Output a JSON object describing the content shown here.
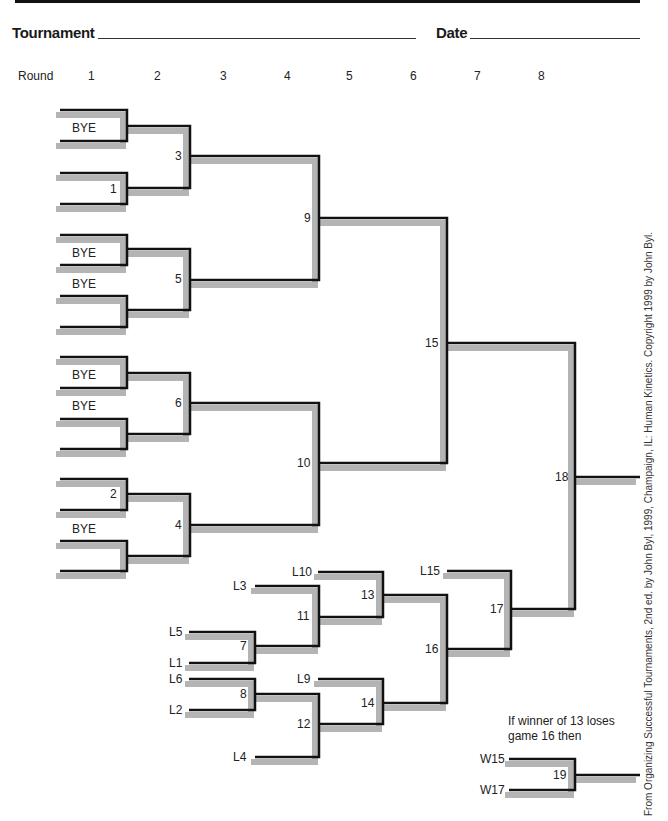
{
  "header": {
    "tournament_label": "Tournament",
    "date_label": "Date"
  },
  "rounds": {
    "label": "Round",
    "items": [
      {
        "n": "1",
        "x": 88
      },
      {
        "n": "2",
        "x": 154
      },
      {
        "n": "3",
        "x": 220
      },
      {
        "n": "4",
        "x": 284
      },
      {
        "n": "5",
        "x": 346
      },
      {
        "n": "6",
        "x": 410
      },
      {
        "n": "7",
        "x": 474
      },
      {
        "n": "8",
        "x": 538
      }
    ]
  },
  "labels": [
    {
      "text": "BYE",
      "x": 72,
      "y": 121
    },
    {
      "text": "1",
      "x": 110,
      "y": 182
    },
    {
      "text": "BYE",
      "x": 72,
      "y": 246
    },
    {
      "text": "BYE",
      "x": 72,
      "y": 277
    },
    {
      "text": "BYE",
      "x": 72,
      "y": 368
    },
    {
      "text": "BYE",
      "x": 72,
      "y": 399
    },
    {
      "text": "2",
      "x": 110,
      "y": 487
    },
    {
      "text": "BYE",
      "x": 72,
      "y": 522
    },
    {
      "text": "3",
      "x": 175,
      "y": 149
    },
    {
      "text": "5",
      "x": 175,
      "y": 272
    },
    {
      "text": "6",
      "x": 175,
      "y": 396
    },
    {
      "text": "4",
      "x": 175,
      "y": 518
    },
    {
      "text": "9",
      "x": 304,
      "y": 211
    },
    {
      "text": "10",
      "x": 297,
      "y": 456
    },
    {
      "text": "15",
      "x": 425,
      "y": 336
    },
    {
      "text": "18",
      "x": 555,
      "y": 470
    },
    {
      "text": "L10",
      "x": 292,
      "y": 565
    },
    {
      "text": "L3",
      "x": 233,
      "y": 579
    },
    {
      "text": "13",
      "x": 361,
      "y": 588
    },
    {
      "text": "11",
      "x": 297,
      "y": 609
    },
    {
      "text": "L15",
      "x": 420,
      "y": 564
    },
    {
      "text": "17",
      "x": 490,
      "y": 602
    },
    {
      "text": "L5",
      "x": 169,
      "y": 625
    },
    {
      "text": "7",
      "x": 240,
      "y": 639
    },
    {
      "text": "16",
      "x": 425,
      "y": 642
    },
    {
      "text": "L1",
      "x": 169,
      "y": 656
    },
    {
      "text": "L6",
      "x": 169,
      "y": 672
    },
    {
      "text": "8",
      "x": 240,
      "y": 687
    },
    {
      "text": "L9",
      "x": 297,
      "y": 672
    },
    {
      "text": "14",
      "x": 361,
      "y": 696
    },
    {
      "text": "L2",
      "x": 169,
      "y": 703
    },
    {
      "text": "12",
      "x": 297,
      "y": 717
    },
    {
      "text": "L4",
      "x": 233,
      "y": 750
    },
    {
      "text": "W15",
      "x": 480,
      "y": 752
    },
    {
      "text": "19",
      "x": 553,
      "y": 768
    },
    {
      "text": "W17",
      "x": 480,
      "y": 783
    }
  ],
  "note": {
    "line1": "If winner of 13 loses",
    "line2": "game 16 then"
  },
  "credit": "From Organizing Successful Tournaments, 2nd ed. by John Byl, 1999, Champaign, IL: Human Kinetics. Copyright 1999 by John Byl.",
  "brackets": [
    [
      [
        60,
        110
      ],
      [
        127,
        110
      ],
      [
        127,
        141
      ],
      [
        60,
        141
      ]
    ],
    [
      [
        60,
        173
      ],
      [
        127,
        173
      ],
      [
        127,
        204
      ],
      [
        60,
        204
      ]
    ],
    [
      [
        60,
        235
      ],
      [
        127,
        235
      ],
      [
        127,
        265
      ],
      [
        60,
        265
      ]
    ],
    [
      [
        60,
        296
      ],
      [
        127,
        296
      ],
      [
        127,
        327
      ],
      [
        60,
        327
      ]
    ],
    [
      [
        60,
        357
      ],
      [
        127,
        357
      ],
      [
        127,
        388
      ],
      [
        60,
        388
      ]
    ],
    [
      [
        60,
        419
      ],
      [
        127,
        419
      ],
      [
        127,
        449
      ],
      [
        60,
        449
      ]
    ],
    [
      [
        60,
        479
      ],
      [
        127,
        479
      ],
      [
        127,
        510
      ],
      [
        60,
        510
      ]
    ],
    [
      [
        60,
        541
      ],
      [
        127,
        541
      ],
      [
        127,
        571
      ],
      [
        60,
        571
      ]
    ],
    [
      [
        127,
        126
      ],
      [
        190,
        126
      ],
      [
        190,
        188
      ],
      [
        127,
        188
      ]
    ],
    [
      [
        127,
        249
      ],
      [
        190,
        249
      ],
      [
        190,
        310
      ],
      [
        127,
        310
      ]
    ],
    [
      [
        127,
        373
      ],
      [
        190,
        373
      ],
      [
        190,
        434
      ],
      [
        127,
        434
      ]
    ],
    [
      [
        127,
        494
      ],
      [
        190,
        494
      ],
      [
        190,
        556
      ],
      [
        127,
        556
      ]
    ],
    [
      [
        190,
        156
      ],
      [
        319,
        156
      ],
      [
        319,
        280
      ],
      [
        190,
        280
      ]
    ],
    [
      [
        190,
        403
      ],
      [
        319,
        403
      ],
      [
        319,
        525
      ],
      [
        190,
        525
      ]
    ],
    [
      [
        319,
        218
      ],
      [
        447,
        218
      ],
      [
        447,
        463
      ],
      [
        319,
        463
      ]
    ],
    [
      [
        447,
        343
      ],
      [
        575,
        343
      ],
      [
        575,
        609
      ],
      [
        511,
        609
      ]
    ],
    [
      [
        575,
        477
      ],
      [
        640,
        477
      ]
    ],
    [
      [
        255,
        586
      ],
      [
        319,
        586
      ],
      [
        319,
        646
      ],
      [
        255,
        646
      ]
    ],
    [
      [
        189,
        632
      ],
      [
        255,
        632
      ],
      [
        255,
        663
      ],
      [
        189,
        663
      ]
    ],
    [
      [
        318,
        572
      ],
      [
        383,
        572
      ],
      [
        383,
        617
      ],
      [
        319,
        617
      ]
    ],
    [
      [
        383,
        595
      ],
      [
        447,
        595
      ],
      [
        447,
        703
      ],
      [
        383,
        703
      ]
    ],
    [
      [
        189,
        679
      ],
      [
        255,
        679
      ],
      [
        255,
        710
      ],
      [
        189,
        710
      ]
    ],
    [
      [
        255,
        694
      ],
      [
        319,
        694
      ],
      [
        319,
        757
      ],
      [
        255,
        757
      ]
    ],
    [
      [
        318,
        679
      ],
      [
        383,
        679
      ],
      [
        383,
        724
      ],
      [
        319,
        724
      ]
    ],
    [
      [
        447,
        571
      ],
      [
        511,
        571
      ],
      [
        511,
        649
      ],
      [
        447,
        649
      ]
    ],
    [
      [
        509,
        759
      ],
      [
        575,
        759
      ],
      [
        575,
        790
      ],
      [
        509,
        790
      ]
    ],
    [
      [
        575,
        775
      ],
      [
        640,
        775
      ]
    ]
  ],
  "colors": {
    "line": "#111111",
    "shadow": "#b4b4b4"
  }
}
